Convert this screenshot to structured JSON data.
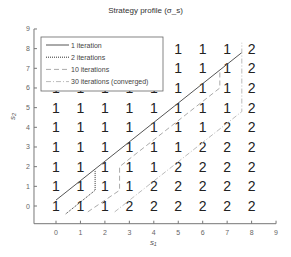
{
  "chart_data": {
    "type": "scatter",
    "title": "Strategy profile (σ_s)",
    "xlabel": "s₁",
    "ylabel": "s₂",
    "xlim": [
      -0.9,
      9
    ],
    "ylim": [
      -0.9,
      9
    ],
    "xticks": [
      0,
      1,
      2,
      3,
      4,
      5,
      6,
      7,
      8,
      9
    ],
    "yticks": [
      0,
      1,
      2,
      3,
      4,
      5,
      6,
      7,
      8,
      9
    ],
    "grid": false,
    "legend_position": "upper left",
    "legend": [
      "1 iteration",
      "2 iterations",
      "10 iterations",
      "30 iterations (converged)"
    ],
    "grid_labels": {
      "description": "Strategy label at integer (s1, s2); rows listed from s2=8 down to s2=0, columns s1=0..8; null = not shown (hidden by legend)",
      "rows": [
        {
          "s2": 8,
          "values": [
            null,
            null,
            null,
            null,
            null,
            "1",
            "1",
            "1",
            "2"
          ]
        },
        {
          "s2": 7,
          "values": [
            null,
            null,
            null,
            null,
            null,
            "1",
            "1",
            "1",
            "2"
          ]
        },
        {
          "s2": 6,
          "values": [
            "1",
            "1",
            "1",
            "1",
            "1",
            "1",
            "1",
            "1",
            "2"
          ]
        },
        {
          "s2": 5,
          "values": [
            "1",
            "1",
            "1",
            "1",
            "1",
            "1",
            "1",
            "1",
            "2"
          ]
        },
        {
          "s2": 4,
          "values": [
            "1",
            "1",
            "1",
            "1",
            "1",
            "1",
            "1",
            "2",
            "2"
          ]
        },
        {
          "s2": 3,
          "values": [
            "1",
            "1",
            "1",
            "1",
            "1",
            "1",
            "2",
            "2",
            "2"
          ]
        },
        {
          "s2": 2,
          "values": [
            "1",
            "1",
            "1",
            "1",
            "1",
            "2",
            "2",
            "2",
            "2"
          ]
        },
        {
          "s2": 1,
          "values": [
            "1",
            "1",
            "1",
            "1",
            "2",
            "2",
            "2",
            "2",
            "2"
          ]
        },
        {
          "s2": 0,
          "values": [
            "1",
            "1",
            "1",
            "2",
            "2",
            "2",
            "2",
            "2",
            "2"
          ]
        }
      ]
    },
    "series": [
      {
        "name": "1 iteration",
        "style": "solid",
        "color": "#555555",
        "points": [
          [
            0.0,
            0.3
          ],
          [
            7.6,
            7.8
          ]
        ]
      },
      {
        "name": "2 iterations",
        "style": "dotted",
        "color": "#333333",
        "points": [
          [
            0.4,
            -0.4
          ],
          [
            1.6,
            0.8
          ],
          [
            1.6,
            1.8
          ]
        ]
      },
      {
        "name": "10 iterations",
        "style": "dashed",
        "color": "#aaaaaa",
        "points": [
          [
            1.3,
            -0.3
          ],
          [
            2.6,
            0.8
          ],
          [
            2.6,
            2.0
          ],
          [
            6.7,
            6.0
          ],
          [
            6.7,
            6.9
          ]
        ]
      },
      {
        "name": "30 iterations (converged)",
        "style": "dashdot",
        "color": "#bbbbbb",
        "points": [
          [
            2.4,
            -0.3
          ],
          [
            7.6,
            4.8
          ],
          [
            7.6,
            8.3
          ]
        ]
      }
    ]
  }
}
